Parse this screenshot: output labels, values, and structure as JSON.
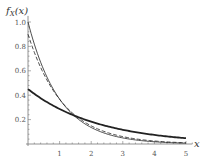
{
  "chart_data": {
    "type": "line",
    "title": "",
    "xlabel": "x",
    "ylabel": "f_X(x)",
    "xlim": [
      0,
      5.2
    ],
    "ylim": [
      0,
      1.05
    ],
    "x_ticks": [
      "1",
      "2",
      "3",
      "4",
      "5"
    ],
    "y_ticks": [
      "0.2",
      "0.4",
      "0.6",
      "0.8",
      "1.0"
    ],
    "grid": false,
    "legend": null,
    "series": [
      {
        "name": "thin solid",
        "style": "thin-solid",
        "formula": "1.0*exp(-1.0*x)",
        "x": [
          0,
          0.5,
          1,
          1.5,
          2,
          2.5,
          3,
          3.5,
          4,
          4.5,
          5
        ],
        "values": [
          1.0,
          0.61,
          0.37,
          0.22,
          0.14,
          0.08,
          0.05,
          0.03,
          0.02,
          0.01,
          0.01
        ]
      },
      {
        "name": "dashed",
        "style": "dashed",
        "formula": "0.9*exp(-0.9*x)",
        "x": [
          0,
          0.5,
          1,
          1.5,
          2,
          2.5,
          3,
          3.5,
          4,
          4.5,
          5
        ],
        "values": [
          0.9,
          0.57,
          0.37,
          0.23,
          0.15,
          0.09,
          0.06,
          0.04,
          0.02,
          0.02,
          0.01
        ]
      },
      {
        "name": "thick solid",
        "style": "thick-solid",
        "formula": "0.45*exp(-0.45*x)",
        "x": [
          0,
          0.5,
          1,
          1.5,
          2,
          2.5,
          3,
          3.5,
          4,
          4.5,
          5
        ],
        "values": [
          0.45,
          0.36,
          0.29,
          0.23,
          0.18,
          0.15,
          0.12,
          0.09,
          0.07,
          0.06,
          0.05
        ]
      }
    ]
  },
  "axes": {
    "ylabel_main": "f",
    "ylabel_sub": "X",
    "ylabel_arg": "(x)",
    "xlabel": "x"
  }
}
